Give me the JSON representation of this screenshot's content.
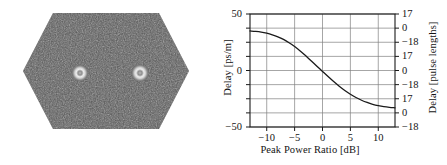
{
  "figure": {
    "panels": [
      {
        "name": "left-image-panel",
        "type": "grayscale-noise-image",
        "shape": "hexagon",
        "description": "Noisy dark grey hexagonal field with two bright ring-shaped spots",
        "spots": [
          {
            "label": "spot-left",
            "cx": 0.345,
            "cy": 0.515
          },
          {
            "label": "spot-right",
            "cx": 0.7,
            "cy": 0.515
          }
        ],
        "colors": {
          "field": "#575757",
          "background": "#ffffff",
          "spot_core": "#d8d8d8",
          "spot_ring": "#f0f0f0"
        }
      },
      {
        "name": "right-plot-panel",
        "type": "line-plot"
      }
    ]
  },
  "chart_data": {
    "type": "line",
    "title": "",
    "xlabel": "Peak Power Ratio [dB]",
    "ylabel": "Delay [ps/m]",
    "ylabel_right": "Delay [pulse lengths]",
    "xlim": [
      -13,
      13
    ],
    "ylim": [
      -50,
      50
    ],
    "ylim_right": [
      -18,
      17
    ],
    "grid": true,
    "legend": null,
    "xticks": [
      -10,
      -5,
      0,
      5,
      10
    ],
    "xticklabels": [
      "−10",
      "−5",
      "0",
      "5",
      "10"
    ],
    "yticks_left": [
      50,
      0,
      -50
    ],
    "yticklabels_left": [
      "50",
      "0",
      "−50"
    ],
    "yticks_right": [
      50.0,
      37.5,
      25.0,
      12.5,
      0.0,
      -12.5,
      -25.0,
      -37.5,
      -50.0
    ],
    "yticklabels_right": [
      "17",
      "0",
      "−18",
      "17",
      "0",
      "−18",
      "17",
      "0",
      "−18"
    ],
    "gridlines_y": [
      50.0,
      37.5,
      25.0,
      12.5,
      0.0,
      -12.5,
      -25.0,
      -37.5,
      -50.0
    ],
    "gridlines_x": [
      -10,
      -5,
      0,
      5,
      10
    ],
    "series": [
      {
        "name": "delay-curve",
        "color": "#1a1a1a",
        "x": [
          -13,
          -12,
          -11,
          -10,
          -9,
          -8,
          -7,
          -6,
          -5,
          -4,
          -3,
          -2,
          -1,
          0,
          1,
          2,
          3,
          4,
          5,
          6,
          7,
          8,
          9,
          10,
          11,
          12,
          13
        ],
        "y": [
          35,
          34.6,
          34,
          33,
          31.6,
          29.8,
          27.5,
          24.6,
          21.2,
          17.3,
          13,
          8.4,
          3.8,
          -0.8,
          -5.4,
          -9.8,
          -13.9,
          -17.7,
          -21,
          -23.9,
          -26.3,
          -28.3,
          -29.9,
          -31.1,
          -32,
          -32.6,
          -33
        ]
      }
    ]
  }
}
